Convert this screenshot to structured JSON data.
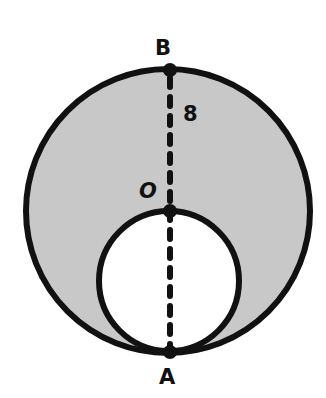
{
  "diagram": {
    "labels": {
      "top_point": "B",
      "center_point": "O",
      "bottom_point": "A",
      "radius_value": "8"
    },
    "colors": {
      "shaded_fill": "#c8c8c8",
      "inner_fill": "#ffffff",
      "stroke": "#111111",
      "background": "#ffffff"
    },
    "geometry": {
      "outer_circle": {
        "cx": 168,
        "cy": 211,
        "r": 142
      },
      "inner_circle": {
        "cx": 169,
        "cy": 281,
        "r": 71
      },
      "points": {
        "B": {
          "x": 170,
          "y": 70
        },
        "O": {
          "x": 170,
          "y": 211
        },
        "A": {
          "x": 170,
          "y": 352
        }
      }
    }
  }
}
